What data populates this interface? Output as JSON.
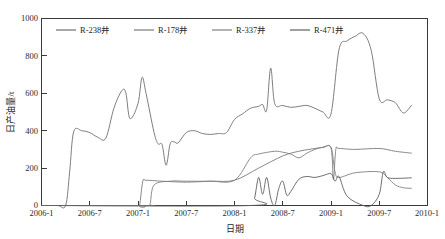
{
  "chart_data": {
    "type": "line",
    "title": "",
    "xlabel": "日期",
    "ylabel": "日产油量/t",
    "grid": false,
    "legend_position": "top-inside",
    "xlim": [
      "2006-1",
      "2010-1"
    ],
    "ylim": [
      0,
      1000
    ],
    "yticks": [
      0,
      200,
      400,
      600,
      800,
      1000
    ],
    "ytick_labels": [
      "0",
      "200",
      "400",
      "600",
      "800",
      "1000"
    ],
    "xticks": [
      "2006-1",
      "2006-7",
      "2007-1",
      "2007-7",
      "2008-1",
      "2008-7",
      "2009-1",
      "2009-7",
      "2010-1"
    ],
    "series": [
      {
        "name": "R-238井",
        "color": "#6f6f6f",
        "x": [
          "2006-1",
          "2006-3",
          "2006-4",
          "2006-4.5",
          "2006-5",
          "2006-6",
          "2006-7",
          "2006-8",
          "2006-9",
          "2006-10",
          "2006-11",
          "2006-11.5",
          "2006-12",
          "2007-1",
          "2007-1.5",
          "2007-2",
          "2007-3",
          "2007-3.5",
          "2007-4",
          "2007-4.5",
          "2007-5",
          "2007-5.5",
          "2007-6",
          "2007-7",
          "2007-8",
          "2007-9",
          "2007-10",
          "2007-11",
          "2007-12",
          "2008-1",
          "2008-2",
          "2008-3",
          "2008-4",
          "2008-4.5",
          "2008-5",
          "2008-5.5",
          "2008-6",
          "2008-7",
          "2008-8",
          "2008-9",
          "2008-10",
          "2008-11",
          "2008-12",
          "2009-1",
          "2009-2",
          "2009-3",
          "2009-4",
          "2009-5",
          "2009-6",
          "2009-7",
          "2009-8",
          "2009-9",
          "2009-10",
          "2009-11"
        ],
        "y": [
          0,
          0,
          0,
          180,
          395,
          400,
          390,
          365,
          360,
          520,
          615,
          600,
          465,
          545,
          685,
          600,
          390,
          330,
          325,
          215,
          330,
          340,
          335,
          390,
          400,
          385,
          380,
          385,
          390,
          460,
          490,
          520,
          530,
          540,
          510,
          735,
          545,
          535,
          525,
          530,
          535,
          520,
          500,
          490,
          835,
          880,
          905,
          920,
          830,
          570,
          565,
          550,
          495,
          535
        ]
      },
      {
        "name": "R-178井",
        "color": "#7a7a7a",
        "x": [
          "2006-1",
          "2007-1",
          "2007-1.2",
          "2007-1.6",
          "2007-2",
          "2007-4",
          "2007-7",
          "2007-10",
          "2008-1",
          "2008-4",
          "2008-7",
          "2008-9",
          "2008-11",
          "2008-12",
          "2009-1",
          "2009-1.3",
          "2009-1.6",
          "2009-2",
          "2009-4",
          "2009-7",
          "2009-9",
          "2009-11"
        ],
        "y": [
          0,
          0,
          0,
          130,
          135,
          130,
          125,
          130,
          135,
          200,
          265,
          290,
          305,
          310,
          308,
          140,
          300,
          305,
          300,
          305,
          290,
          280
        ]
      },
      {
        "name": "R-337井",
        "color": "#808080",
        "x": [
          "2006-1",
          "2007-2",
          "2007-2.5",
          "2007-3",
          "2007-5",
          "2007-7",
          "2007-10",
          "2008-1",
          "2008-3",
          "2008-4",
          "2008-6",
          "2008-7",
          "2008-8",
          "2008-9",
          "2008-10",
          "2008-11",
          "2008-12",
          "2009-1",
          "2009-1.5",
          "2009-2",
          "2009-4",
          "2009-7",
          "2009-8",
          "2009-9",
          "2009-10",
          "2009-11"
        ],
        "y": [
          0,
          0,
          10,
          110,
          130,
          130,
          130,
          135,
          255,
          275,
          290,
          285,
          275,
          255,
          280,
          300,
          312,
          310,
          180,
          150,
          175,
          180,
          150,
          110,
          95,
          92
        ]
      },
      {
        "name": "R-471井",
        "color": "#5f5f5f",
        "x": [
          "2006-1",
          "2008-3",
          "2008-3.5",
          "2008-4",
          "2008-4.5",
          "2008-5",
          "2008-5.5",
          "2008-6",
          "2008-6.5",
          "2008-7",
          "2008-7.5",
          "2008-8",
          "2008-9",
          "2008-10",
          "2008-11",
          "2008-12",
          "2009-1",
          "2009-1.5",
          "2009-2",
          "2009-3",
          "2009-5",
          "2009-6",
          "2009-7",
          "2009-7.5",
          "2009-8",
          "2009-9",
          "2009-11"
        ],
        "y": [
          0,
          0,
          40,
          150,
          60,
          150,
          40,
          0,
          90,
          130,
          55,
          75,
          140,
          155,
          150,
          160,
          170,
          130,
          155,
          50,
          0,
          0,
          60,
          180,
          150,
          145,
          148
        ]
      }
    ]
  },
  "legend": {
    "items": [
      {
        "label": "R-238井"
      },
      {
        "label": "R-178井"
      },
      {
        "label": "R-337井"
      },
      {
        "label": "R-471井"
      }
    ]
  }
}
